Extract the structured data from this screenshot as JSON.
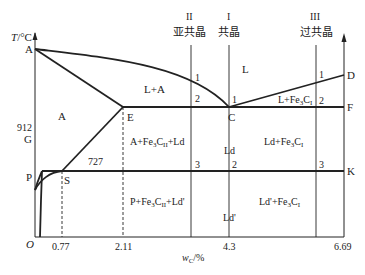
{
  "diagram": {
    "y_axis_label": "T/°C",
    "x_axis_label": "w_C/%",
    "x_axis_sub": "C",
    "origin": "O",
    "x_ticks": [
      "0.77",
      "2.11",
      "4.3",
      "6.69"
    ],
    "y_ticks": [
      "912"
    ],
    "points": {
      "A": "A",
      "D": "D",
      "E": "E",
      "C": "C",
      "F": "F",
      "G": "G",
      "S": "S",
      "P": "P",
      "K": "K"
    },
    "temperature_727": "727",
    "alloy_lines": [
      {
        "roman": "II",
        "name": "亚共晶"
      },
      {
        "roman": "I",
        "name": "共晶"
      },
      {
        "roman": "III",
        "name": "过共晶"
      }
    ],
    "regions": {
      "liquid": "L",
      "l_plus_a": "L+A",
      "austenite": "A",
      "l_plus_fe3c_base": "L+Fe",
      "l_plus_fe3c_sub": "3",
      "l_plus_fe3c_c": "C",
      "l_plus_fe3c_subI": "I",
      "a_fe3c_ld_1": "A+Fe",
      "a_fe3c_ld_sub3": "3",
      "a_fe3c_ld_c": "C",
      "a_fe3c_ld_subII": "II",
      "a_fe3c_ld_2": "+Ld",
      "ld": "Ld",
      "ld_fe3c_1": "Ld+Fe",
      "ld_fe3c_sub3": "3",
      "ld_fe3c_c": "C",
      "ld_fe3c_subI": "I",
      "p_fe3c_ld_1": "P+Fe",
      "p_fe3c_ld_sub3": "3",
      "p_fe3c_ld_c": "C",
      "p_fe3c_ld_subII": "II",
      "p_fe3c_ld_2": "+Ld'",
      "ld_prime": "Ld'",
      "ldp_fe3c_1": "Ld'+Fe",
      "ldp_fe3c_sub3": "3",
      "ldp_fe3c_c": "C",
      "ldp_fe3c_subI": "I"
    },
    "intersection_markers": {
      "II_1": "1",
      "II_2": "2",
      "II_3": "3",
      "I_1": "1",
      "I_2": "2",
      "III_1": "1",
      "III_2": "2",
      "III_3": "3"
    }
  }
}
